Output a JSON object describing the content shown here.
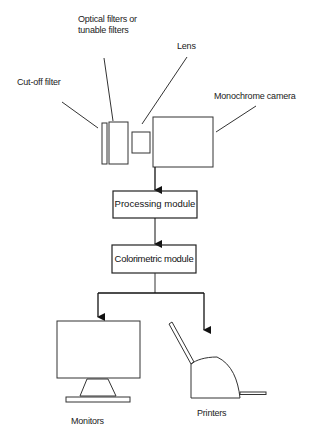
{
  "diagram": {
    "labels": {
      "optical_filters_line1": "Optical filters or",
      "optical_filters_line2": "tunable filters",
      "lens": "Lens",
      "cutoff_filter": "Cut-off filter",
      "monochrome_camera": "Monochrome camera",
      "monitors": "Monitors",
      "printers": "Printers"
    },
    "modules": {
      "processing": "Processing module",
      "colorimetric": "Colorimetric module"
    },
    "colors": {
      "stroke": "#333333",
      "background": "#ffffff"
    }
  }
}
